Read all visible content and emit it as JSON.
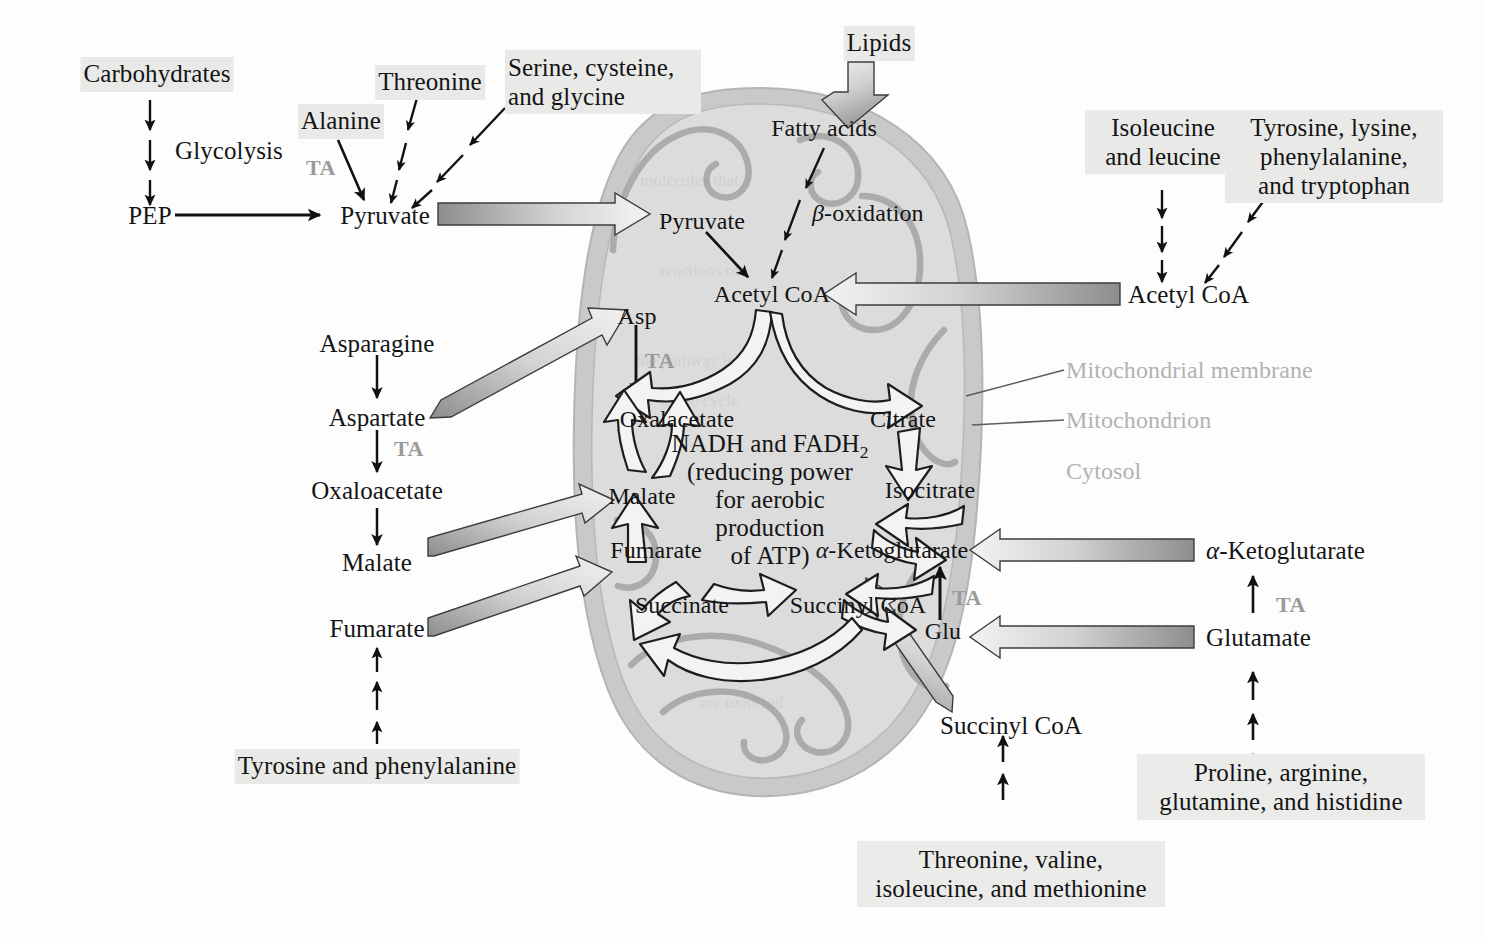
{
  "diagram": {
    "colors": {
      "mito_outer": "#c9c9c9",
      "mito_inner": "#dcdcdc",
      "crista_stroke": "#a9a9a9",
      "text": "#141414",
      "ta_gray": "#9a9a9a",
      "annot_gray": "#b2b2b2",
      "highlight": "#e9e9e7",
      "arrow_dark": "#808080",
      "arrow_light": "#ededed"
    }
  },
  "cytosol": {
    "carbohydrates": "Carbohydrates",
    "glycolysis": "Glycolysis",
    "pep": "PEP",
    "pyruvate": "Pyruvate",
    "alanine": "Alanine",
    "threonine": "Threonine",
    "serine_cysteine_glycine_1": "Serine, cysteine,",
    "serine_cysteine_glycine_2": "and glycine",
    "lipids": "Lipids",
    "isoleucine_leucine_1": "Isoleucine",
    "isoleucine_leucine_2": "and leucine",
    "tyr_lys_phe_trp_1": "Tyrosine, lysine,",
    "tyr_lys_phe_trp_2": "phenylalanine,",
    "tyr_lys_phe_trp_3": "and tryptophan",
    "acetyl_coa_out": "Acetyl CoA",
    "asparagine": "Asparagine",
    "aspartate": "Aspartate",
    "oxaloacetate": "Oxaloacetate",
    "malate": "Malate",
    "fumarate": "Fumarate",
    "tyrosine_phenylalanine": "Tyrosine and phenylalanine",
    "succinyl_coa_out": "Succinyl CoA",
    "threonine_valine_1": "Threonine, valine,",
    "threonine_valine_2": "isoleucine, and methionine",
    "alpha_ketoglutarate_out": "α-Ketoglutarate",
    "glutamate_out": "Glutamate",
    "proline_arginine_1": "Proline, arginine,",
    "proline_arginine_2": "glutamine, and histidine",
    "ta_label": "TA"
  },
  "mitochondrion": {
    "pyruvate": "Pyruvate",
    "fatty_acids": "Fatty acids",
    "beta_oxidation_prefix": "β",
    "beta_oxidation_suffix": "-oxidation",
    "acetyl_coa": "Acetyl CoA",
    "asp": "Asp",
    "oxaloacetate": "Oxalacetate",
    "citrate": "Citrate",
    "isocitrate": "Isocitrate",
    "alpha_ketoglutarate": "α-Ketoglutarate",
    "succinyl_coa": "Succinyl CoA",
    "succinate": "Succinate",
    "fumarate": "Fumarate",
    "malate": "Malate",
    "glu": "Glu",
    "ta_label": "TA",
    "center_note": {
      "line1_a": "NADH and FADH",
      "line1_sub": "2",
      "line2": "(reducing power",
      "line3": "for aerobic",
      "line4": "production",
      "line5": "of ATP)"
    }
  },
  "annotations": {
    "mitochondrial_membrane": "Mitochondrial membrane",
    "mitochondrion": "Mitochondrion",
    "cytosol": "Cytosol"
  }
}
